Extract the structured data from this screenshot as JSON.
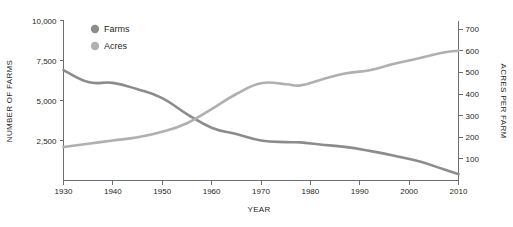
{
  "chart_data": {
    "type": "line",
    "title": "",
    "subtitle": "",
    "xlabel": "YEAR",
    "ylabel": "NUMBER OF FARMS",
    "y2label": "ACRES PER FARM",
    "grid": false,
    "legend_position": "top-left",
    "x": [
      1930,
      1935,
      1940,
      1945,
      1950,
      1955,
      1960,
      1965,
      1970,
      1975,
      1978,
      1982,
      1987,
      1992,
      1997,
      2002,
      2007,
      2010
    ],
    "xlim": [
      1930,
      2010
    ],
    "xticks": [
      1930,
      1940,
      1950,
      1960,
      1970,
      1980,
      1990,
      2000,
      2010
    ],
    "xticklabels": [
      "1930",
      "1940",
      "1950",
      "1960",
      "1970",
      "1980",
      "1990",
      "2000",
      "2010"
    ],
    "ylim": [
      0,
      10000
    ],
    "yticks": [
      2500,
      5000,
      7500,
      10000
    ],
    "yticklabels": [
      "2,500",
      "5,000",
      "7,500",
      "10,000"
    ],
    "y2lim": [
      0,
      740
    ],
    "y2ticks": [
      100,
      200,
      300,
      400,
      500,
      600,
      700
    ],
    "y2ticklabels": [
      "100",
      "200",
      "300",
      "400",
      "500",
      "600",
      "700"
    ],
    "series": [
      {
        "name": "Farms",
        "axis": "left",
        "color": "#8c8c8c",
        "values": [
          6900,
          6150,
          6100,
          5700,
          5150,
          4150,
          3300,
          2900,
          2500,
          2400,
          2380,
          2250,
          2100,
          1850,
          1550,
          1200,
          700,
          400
        ]
      },
      {
        "name": "Acres",
        "axis": "right",
        "color": "#b0b0b0",
        "values": [
          155,
          170,
          185,
          200,
          225,
          265,
          330,
          400,
          450,
          445,
          440,
          465,
          495,
          510,
          540,
          565,
          592,
          600
        ]
      }
    ],
    "legend": [
      {
        "label": "Farms",
        "color": "#8c8c8c",
        "marker": "circle"
      },
      {
        "label": "Acres",
        "color": "#b0b0b0",
        "marker": "circle"
      }
    ],
    "annotations": []
  }
}
